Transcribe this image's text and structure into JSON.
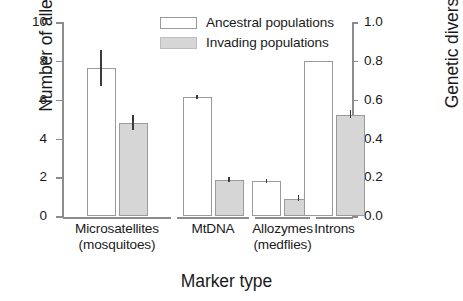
{
  "chart_data": {
    "type": "bar",
    "title": "",
    "xlabel": "Marker type",
    "ylabel": "Number of alleles",
    "ylabel_right": "Genetic diversity",
    "ylim": [
      0,
      10
    ],
    "ylim_right": [
      0.0,
      1.0
    ],
    "grid": false,
    "legend_position": "top-center",
    "categories": [
      "Microsatellites (mosquitoes)",
      "MtDNA",
      "Allozymes (medflies)",
      "Introns"
    ],
    "category_lines": [
      [
        "Microsatellites",
        "(mosquitoes)"
      ],
      [
        "MtDNA",
        ""
      ],
      [
        "Allozymes",
        "(medflies)"
      ],
      [
        "Introns",
        ""
      ]
    ],
    "series": [
      {
        "name": "Ancestral populations",
        "color": "#ffffff",
        "edge_color": "#9a9a9a",
        "values": [
          7.65,
          6.12,
          1.8,
          0.8
        ],
        "err_low": [
          6.72,
          6.05,
          1.7,
          null
        ],
        "err_high": [
          8.55,
          6.22,
          1.92,
          null
        ],
        "axis": [
          "left",
          "left",
          "left",
          "right"
        ]
      },
      {
        "name": "Invading populations",
        "color": "#d6d6d6",
        "edge_color": "#9a9a9a",
        "values": [
          4.78,
          1.88,
          0.9,
          0.52
        ],
        "err_low": [
          4.45,
          1.76,
          0.76,
          0.505
        ],
        "err_high": [
          5.22,
          2.02,
          1.08,
          0.545
        ],
        "axis": [
          "left",
          "left",
          "left",
          "right"
        ]
      }
    ],
    "yticks_left": [
      "0",
      "2",
      "4",
      "6",
      "8",
      "10"
    ],
    "ytick_values_left": [
      0,
      2,
      4,
      6,
      8,
      10
    ],
    "yticks_right": [
      "0.0",
      "0.2",
      "0.4",
      "0.6",
      "0.8",
      "1.0"
    ],
    "ytick_values_right": [
      0.0,
      0.2,
      0.4,
      0.6,
      0.8,
      1.0
    ]
  },
  "legend": {
    "items": [
      {
        "label": "Ancestral populations",
        "swatch": "open-rectangle"
      },
      {
        "label": "Invading populations",
        "swatch": "filled-gray-rectangle"
      }
    ]
  }
}
